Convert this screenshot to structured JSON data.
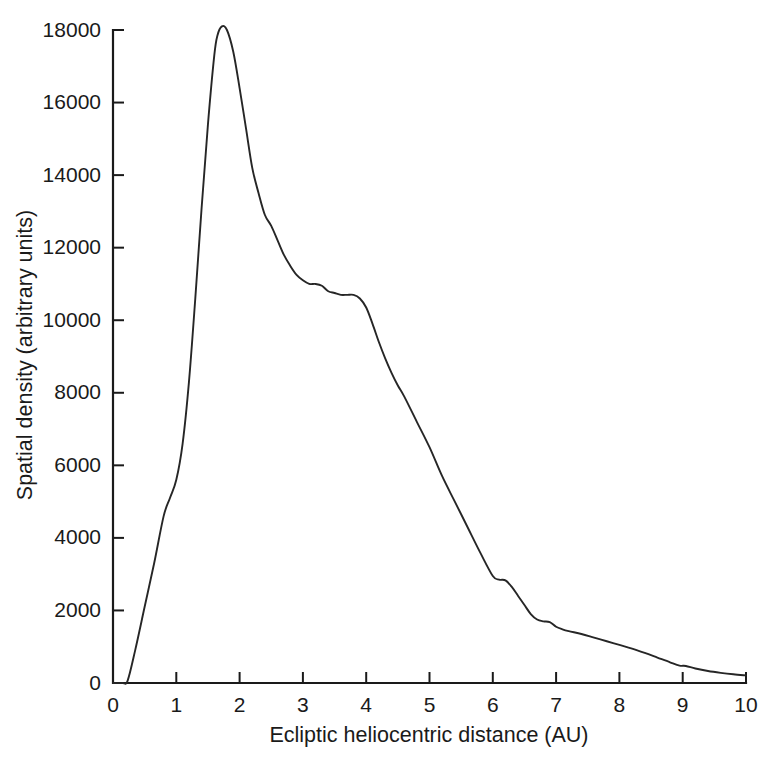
{
  "figure": {
    "background_color": "#ffffff",
    "line_color": "#262626",
    "axis_color": "#1a1a1a"
  },
  "chart_data": {
    "type": "line",
    "title": "",
    "xlabel": "Ecliptic heliocentric distance (AU)",
    "ylabel": "Spatial density (arbitrary units)",
    "xlim": [
      0,
      10
    ],
    "ylim": [
      0,
      18000
    ],
    "grid": false,
    "legend": null,
    "xticks": [
      0,
      1,
      2,
      3,
      4,
      5,
      6,
      7,
      8,
      9,
      10
    ],
    "xtick_labels": [
      "0",
      "1",
      "2",
      "3",
      "4",
      "5",
      "6",
      "7",
      "8",
      "9",
      "10"
    ],
    "yticks": [
      0,
      2000,
      4000,
      6000,
      8000,
      10000,
      12000,
      14000,
      16000,
      18000
    ],
    "ytick_labels": [
      "0",
      "2000",
      "4000",
      "6000",
      "8000",
      "10000",
      "12000",
      "14000",
      "16000",
      "18000"
    ],
    "series": [
      {
        "name": "Spatial density",
        "x": [
          0.0,
          0.15,
          0.23,
          0.35,
          0.5,
          0.65,
          0.8,
          0.9,
          1.0,
          1.1,
          1.2,
          1.3,
          1.4,
          1.5,
          1.6,
          1.65,
          1.72,
          1.8,
          1.9,
          2.0,
          2.1,
          2.2,
          2.3,
          2.4,
          2.5,
          2.6,
          2.7,
          2.8,
          2.9,
          3.0,
          3.1,
          3.2,
          3.3,
          3.4,
          3.5,
          3.6,
          3.7,
          3.8,
          3.9,
          4.0,
          4.1,
          4.2,
          4.3,
          4.4,
          4.5,
          4.6,
          4.8,
          5.0,
          5.2,
          5.4,
          5.6,
          5.8,
          6.0,
          6.1,
          6.2,
          6.3,
          6.4,
          6.5,
          6.6,
          6.7,
          6.8,
          6.9,
          7.0,
          7.1,
          7.2,
          7.4,
          7.6,
          7.8,
          8.0,
          8.2,
          8.4,
          8.6,
          8.8,
          8.95,
          9.05,
          9.2,
          9.4,
          9.6,
          9.8,
          10.0
        ],
        "y": [
          0,
          0,
          60,
          900,
          2100,
          3300,
          4600,
          5100,
          5600,
          6600,
          8300,
          10600,
          13100,
          15400,
          17300,
          17850,
          18100,
          18000,
          17400,
          16400,
          15300,
          14200,
          13500,
          12900,
          12600,
          12200,
          11800,
          11500,
          11250,
          11100,
          11000,
          11000,
          10950,
          10800,
          10750,
          10700,
          10700,
          10700,
          10600,
          10350,
          9900,
          9400,
          8950,
          8550,
          8200,
          7900,
          7200,
          6500,
          5700,
          5000,
          4300,
          3600,
          2950,
          2850,
          2830,
          2650,
          2400,
          2150,
          1900,
          1750,
          1700,
          1680,
          1550,
          1480,
          1430,
          1350,
          1250,
          1150,
          1050,
          950,
          830,
          700,
          570,
          480,
          470,
          400,
          330,
          280,
          240,
          210
        ]
      }
    ],
    "annotations": [
      {
        "label": "peak",
        "x": 1.72,
        "y": 18100
      },
      {
        "label": "shoulder",
        "x": 3.15,
        "y": 11000
      },
      {
        "label": "shoulder",
        "x": 3.85,
        "y": 10700
      },
      {
        "label": "step",
        "x": 6.15,
        "y": 2840
      },
      {
        "label": "step",
        "x": 6.82,
        "y": 1700
      }
    ]
  },
  "axes": {
    "x_axis_title": "Ecliptic heliocentric distance (AU)",
    "y_axis_title": "Spatial density (arbitrary units)"
  },
  "caption": {
    "partial_text": ""
  }
}
